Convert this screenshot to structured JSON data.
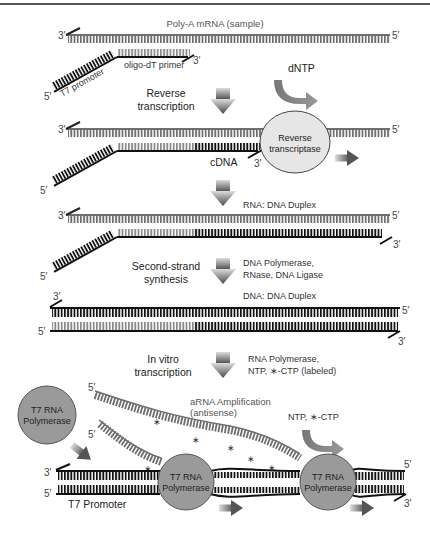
{
  "header": {
    "rule_color": "#555555"
  },
  "colors": {
    "rna_strand": "#6e6e6e",
    "dna_strand": "#111111",
    "primer_rungs": "#888888",
    "process_arrow_top": "#c8c8c8",
    "process_arrow_bottom": "#555555",
    "enzyme_rt_fill": "#e6e6e6",
    "enzyme_t7_fill": "#9a9a9a"
  },
  "step1": {
    "title": "Poly-A mRNA (sample)",
    "end_3": "3′",
    "end_5": "5′",
    "primer_label": "oligo-dT primer",
    "primer_end_3": "3′",
    "promoter_label": "T7 promoter",
    "promoter_end_5": "5′",
    "reagent": "dNTP"
  },
  "arrow1": {
    "label_line1": "Reverse",
    "label_line2": "transcription"
  },
  "step2": {
    "end_3": "3′",
    "end_5": "5′",
    "enzyme_line1": "Reverse",
    "enzyme_line2": "transcriptase",
    "cdna_label": "cDNA",
    "cdna_end_3": "3′",
    "promoter_end_5": "5′"
  },
  "step3": {
    "title": "RNA: DNA Duplex",
    "end_3": "3′",
    "end_5": "5′",
    "lower_end_3": "3′",
    "promoter_end_5": "5′"
  },
  "arrow3": {
    "label_line1": "Second-strand",
    "label_line2": "synthesis",
    "reagents_line1": "DNA Polymerase,",
    "reagents_line2": "RNase, DNA Ligase"
  },
  "step4": {
    "title": "DNA: DNA Duplex",
    "top_end_3": "3′",
    "top_end_5": "5′",
    "bottom_end_5": "5′",
    "bottom_end_3": "3′"
  },
  "arrow4": {
    "label_line1": "In vitro",
    "label_line2": "transcription",
    "reagents_line1": "RNA Polymerase,",
    "reagents_line2": "NTP, ∗-CTP (labeled)"
  },
  "step5": {
    "free_enzyme_line1": "T7 RNA",
    "free_enzyme_line2": "Polymerase",
    "arna_label_line1": "aRNA Amplification",
    "arna_label_line2": "(antisense)",
    "arna_end_5_a": "5′",
    "arna_end_5_b": "5′",
    "reagent": "NTP, ∗-CTP",
    "enzyme1_line1": "T7 RNA",
    "enzyme1_line2": "Polymerase",
    "enzyme2_line1": "T7 RNA",
    "enzyme2_line2": "Polymerase",
    "top_end_3": "3′",
    "top_end_5": "5′",
    "bottom_end_5": "5′",
    "bottom_end_3": "3′",
    "promoter_label": "T7 Promoter",
    "label_marker": "∗"
  }
}
